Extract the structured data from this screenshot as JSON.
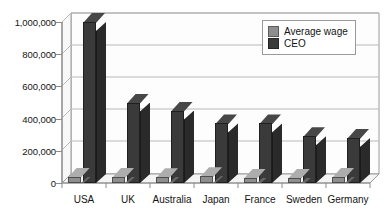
{
  "chart_data": {
    "type": "bar",
    "title": "",
    "subtitle": "",
    "xlabel": "",
    "ylabel": "",
    "categories": [
      "USA",
      "UK",
      "Australia",
      "Japan",
      "France",
      "Sweden",
      "Germany"
    ],
    "series": [
      {
        "name": "Average wage",
        "color": "#8e8e8e",
        "values": [
          40000,
          38000,
          36000,
          42000,
          34000,
          33000,
          37000
        ]
      },
      {
        "name": "CEO",
        "color": "#3a3a3a",
        "values": [
          1000000,
          500000,
          450000,
          370000,
          370000,
          290000,
          280000
        ]
      }
    ],
    "ylim": [
      0,
      1000000
    ],
    "yticks": [
      0,
      200000,
      400000,
      600000,
      800000,
      1000000
    ],
    "ytick_labels": [
      "0",
      "200,000",
      "400,000",
      "600,000",
      "800,000",
      "1,000,000"
    ],
    "grid": true,
    "legend_position": "top-right",
    "projection": "3d"
  },
  "legend": {
    "items": [
      {
        "label": "Average wage",
        "color": "#8e8e8e"
      },
      {
        "label": "CEO",
        "color": "#3a3a3a"
      }
    ]
  },
  "colors": {
    "background": "#ffffff",
    "gridline": "#b9b9b9",
    "axis": "#8d8d8d",
    "wall": "#fdfdfd",
    "floor": "#f4f4f4",
    "series_average_wage": "#8e8e8e",
    "series_ceo": "#3a3a3a",
    "text": "#141414"
  }
}
